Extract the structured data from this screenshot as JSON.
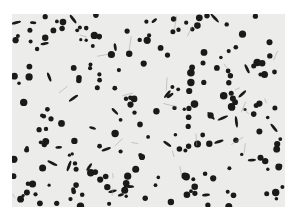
{
  "image": {
    "subject": "micrograph of dark nodules on light matrix",
    "background_color": "#ffffff",
    "panel_color": "#ececea",
    "particle_color": "#1a1a1a"
  }
}
